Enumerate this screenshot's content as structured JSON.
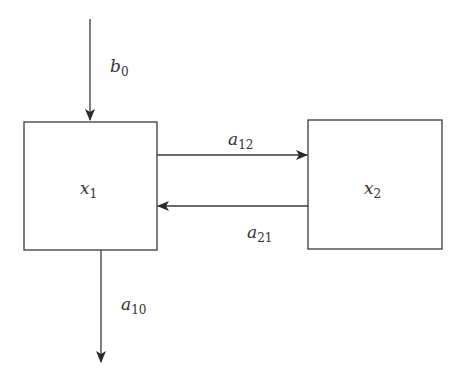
{
  "diagram": {
    "type": "compartment-model",
    "colors": {
      "stroke": "#3a3a3a",
      "text": "#333333",
      "background": "#ffffff"
    },
    "nodes": [
      {
        "id": "x1",
        "base": "x",
        "sub": "1"
      },
      {
        "id": "x2",
        "base": "x",
        "sub": "2"
      }
    ],
    "edges": [
      {
        "id": "b0",
        "from": "input",
        "to": "x1",
        "base": "b",
        "sub": "0"
      },
      {
        "id": "a12",
        "from": "x1",
        "to": "x2",
        "base": "a",
        "sub": "12"
      },
      {
        "id": "a21",
        "from": "x2",
        "to": "x1",
        "base": "a",
        "sub": "21"
      },
      {
        "id": "a10",
        "from": "x1",
        "to": "output",
        "base": "a",
        "sub": "10"
      }
    ]
  }
}
